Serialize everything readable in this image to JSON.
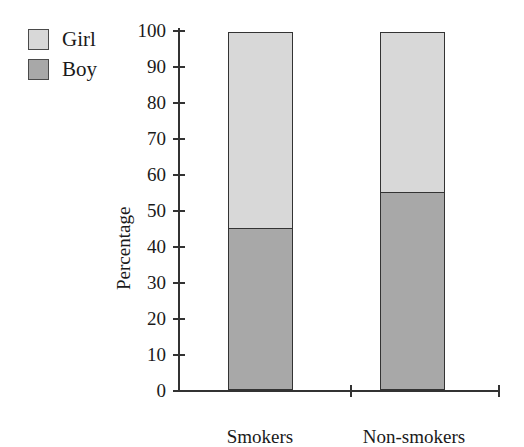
{
  "chart_data": {
    "type": "bar",
    "stacked": true,
    "title": "",
    "xlabel": "",
    "ylabel": "Percentage",
    "categories": [
      "Smokers",
      "Non-smokers"
    ],
    "series": [
      {
        "name": "Boy",
        "values": [
          45,
          55
        ],
        "color": "#a8a8a8"
      },
      {
        "name": "Girl",
        "values": [
          55,
          45
        ],
        "color": "#d8d8d8"
      }
    ],
    "ylim": [
      0,
      100
    ],
    "ytick_values": [
      0,
      10,
      20,
      30,
      40,
      50,
      60,
      70,
      80,
      90,
      100
    ],
    "ytick_labels": [
      "0",
      "10",
      "20",
      "30",
      "40",
      "50",
      "60",
      "70",
      "80",
      "90",
      "100"
    ],
    "grid": false,
    "legend_position": "top-left",
    "legend_entries": [
      "Girl",
      "Boy"
    ]
  },
  "legend": {
    "items": [
      {
        "label": "Girl",
        "swatch": "girl-swatch-icon",
        "color": "#d8d8d8"
      },
      {
        "label": "Boy",
        "swatch": "boy-swatch-icon",
        "color": "#a8a8a8"
      }
    ]
  },
  "axes": {
    "y_title": "Percentage",
    "y_labels": [
      "100",
      "90",
      "80",
      "70",
      "60",
      "50",
      "40",
      "30",
      "20",
      "10",
      "0"
    ],
    "x_labels": [
      "Smokers",
      "Non-smokers"
    ]
  },
  "colors": {
    "girl": "#d8d8d8",
    "boy": "#a8a8a8",
    "outline": "#333333",
    "text": "#1a1a1a",
    "background": "#ffffff"
  }
}
